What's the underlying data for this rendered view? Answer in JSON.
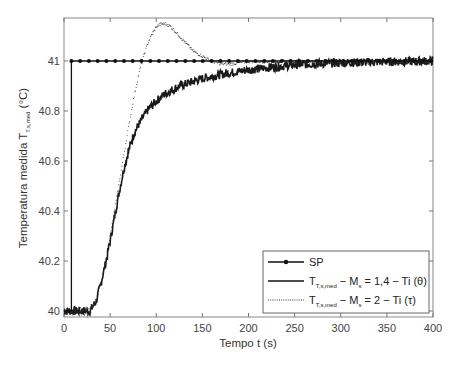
{
  "chart_data": {
    "type": "line",
    "title": "",
    "xlabel": "Tempo t (s)",
    "ylabel": "Temperatura medida T",
    "ylabel_subscript": "T,s,med",
    "ylabel_unit": "(°C)",
    "xlim": [
      0,
      400
    ],
    "ylim": [
      39.97,
      41.17
    ],
    "x_ticks": [
      0,
      50,
      100,
      150,
      200,
      250,
      300,
      350,
      400
    ],
    "x_tick_labels": [
      "0",
      "50",
      "100",
      "150",
      "200",
      "250",
      "300",
      "350",
      "400"
    ],
    "y_ticks": [
      40,
      40.2,
      40.4,
      40.6,
      40.8,
      41
    ],
    "y_tick_labels": [
      "40",
      "40.2",
      "40.4",
      "40.6",
      "40.8",
      "41"
    ],
    "grid": false,
    "legend_position": "lower right",
    "series": [
      {
        "name": "SP",
        "style": "solid-with-markers",
        "x": [
          0,
          8,
          8,
          400
        ],
        "y": [
          40,
          40,
          41,
          41
        ]
      },
      {
        "name": "T_T,s,med − M_s = 1,4 − Ti (θ)",
        "legend_main": "T",
        "legend_sub": "T,s,med",
        "legend_mid": " − M",
        "legend_sub2": "s",
        "legend_tail": " = 1,4 − Ti (θ)",
        "style": "solid-noisy",
        "x": [
          0,
          10,
          20,
          28,
          35,
          40,
          45,
          50,
          55,
          60,
          65,
          70,
          75,
          80,
          90,
          100,
          110,
          125,
          150,
          175,
          200,
          225,
          250,
          300,
          350,
          400
        ],
        "y": [
          40.0,
          40.0,
          40.0,
          40.0,
          40.04,
          40.11,
          40.19,
          40.28,
          40.38,
          40.48,
          40.57,
          40.64,
          40.7,
          40.74,
          40.8,
          40.84,
          40.87,
          40.9,
          40.93,
          40.95,
          40.965,
          40.975,
          40.985,
          40.993,
          40.997,
          41.0
        ]
      },
      {
        "name": "T_T,s,med − M_s = 2 − Ti (τ)",
        "legend_main": "T",
        "legend_sub": "T,s,med",
        "legend_mid": " − M",
        "legend_sub2": "s",
        "legend_tail": " = 2 − Ti (τ)",
        "style": "dotted",
        "x": [
          0,
          10,
          20,
          28,
          35,
          40,
          45,
          50,
          55,
          60,
          65,
          70,
          75,
          80,
          85,
          90,
          95,
          100,
          105,
          110,
          115,
          120,
          130,
          140,
          150,
          160,
          170,
          180,
          200,
          250,
          300,
          400
        ],
        "y": [
          40.0,
          40.0,
          40.0,
          40.0,
          40.05,
          40.12,
          40.21,
          40.31,
          40.42,
          40.53,
          40.64,
          40.75,
          40.85,
          40.94,
          41.01,
          41.07,
          41.11,
          41.14,
          41.15,
          41.15,
          41.14,
          41.12,
          41.08,
          41.04,
          41.02,
          41.0,
          40.99,
          40.99,
          41.0,
          41.0,
          41.0,
          41.0
        ]
      }
    ]
  },
  "legend": {
    "sp_label": "SP",
    "s1_main": "T",
    "s1_sub": "T,s,med",
    "s1_mid": " − M",
    "s1_sub2": "s",
    "s1_tail": " = 1,4 − Ti (θ)",
    "s2_main": "T",
    "s2_sub": "T,s,med",
    "s2_mid": " − M",
    "s2_sub2": "s",
    "s2_tail": " = 2 − Ti (τ)"
  },
  "axes": {
    "xlabel": "Tempo t (s)",
    "ylabel_main": "Temperatura medida T",
    "ylabel_sub": "T,s,med",
    "ylabel_unit": " (°C)"
  }
}
